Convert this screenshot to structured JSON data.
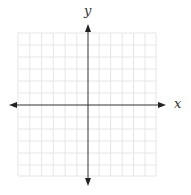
{
  "diagram": {
    "type": "coordinate-plane",
    "x_axis_label": "x",
    "y_axis_label": "y",
    "grid": {
      "columns": 12,
      "rows": 12,
      "color": "#e6e6e6"
    },
    "axis_color": "#333333",
    "background": "#ffffff",
    "arrows": {
      "x_axis": "both-ends",
      "y_axis": "both-ends"
    },
    "ticks_labeled": false
  }
}
